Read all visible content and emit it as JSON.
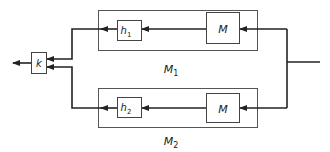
{
  "diagram": {
    "type": "block-diagram",
    "colors": {
      "line": "#222222",
      "box_border": "#555555",
      "background": "#ffffff"
    },
    "blocks": {
      "k": {
        "label": "k"
      },
      "h1": {
        "label": "h",
        "sub": "1"
      },
      "h2": {
        "label": "h",
        "sub": "2"
      },
      "m_top": {
        "label": "M"
      },
      "m_bottom": {
        "label": "M"
      }
    },
    "groups": {
      "m1": {
        "label": "M",
        "sub": "1"
      },
      "m2": {
        "label": "M",
        "sub": "2"
      }
    },
    "connections": [
      "input -> split",
      "split -> M (top)",
      "split -> M (bottom)",
      "M (top) -> h1",
      "M (bottom) -> h2",
      "h1 -> k",
      "h2 -> k",
      "k -> output"
    ]
  }
}
